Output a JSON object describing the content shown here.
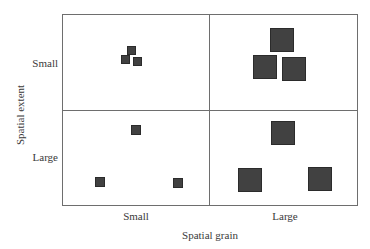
{
  "diagram": {
    "y_axis_label": "Spatial extent",
    "x_axis_label": "Spatial grain",
    "y_ticks": [
      "Small",
      "Large"
    ],
    "x_ticks": [
      "Small",
      "Large"
    ],
    "colors": {
      "square_fill": "#414141",
      "square_border": "#2b2b2b",
      "grid_line": "#6e6e6e"
    },
    "quadrants": [
      {
        "name": "small-extent-small-grain",
        "extent": "Small",
        "grain": "Small",
        "squares": [
          {
            "x": 127,
            "y": 46,
            "size": 9
          },
          {
            "x": 121,
            "y": 55,
            "size": 9
          },
          {
            "x": 133,
            "y": 57,
            "size": 9
          }
        ]
      },
      {
        "name": "small-extent-large-grain",
        "extent": "Small",
        "grain": "Large",
        "squares": [
          {
            "x": 270,
            "y": 28,
            "size": 24
          },
          {
            "x": 253,
            "y": 55,
            "size": 24
          },
          {
            "x": 282,
            "y": 57,
            "size": 24
          }
        ]
      },
      {
        "name": "large-extent-small-grain",
        "extent": "Large",
        "grain": "Small",
        "squares": [
          {
            "x": 131,
            "y": 125,
            "size": 10
          },
          {
            "x": 95,
            "y": 177,
            "size": 10
          },
          {
            "x": 173,
            "y": 178,
            "size": 10
          }
        ]
      },
      {
        "name": "large-extent-large-grain",
        "extent": "Large",
        "grain": "Large",
        "squares": [
          {
            "x": 271,
            "y": 121,
            "size": 24
          },
          {
            "x": 238,
            "y": 168,
            "size": 24
          },
          {
            "x": 308,
            "y": 167,
            "size": 24
          }
        ]
      }
    ]
  }
}
